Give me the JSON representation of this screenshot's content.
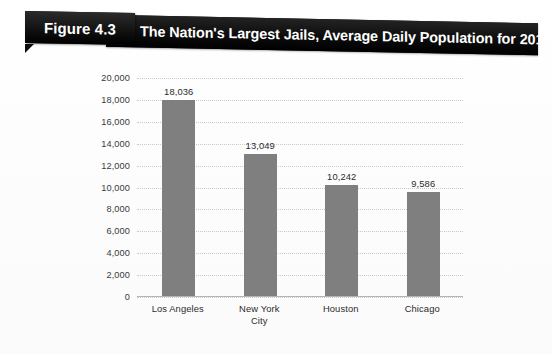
{
  "figure": {
    "number_label": "Figure 4.3",
    "title": "The Nation's Largest Jails, Average Daily Population for 2010"
  },
  "colors": {
    "banner_bg": "#111111",
    "banner_text": "#ffffff",
    "bar_fill": "#7f7f7f",
    "gridline": "#c9c9c9",
    "page_bg": "#ffffff"
  },
  "chart_data": {
    "type": "bar",
    "title": "The Nation's Largest Jails, Average Daily Population for 2010",
    "xlabel": "",
    "ylabel": "",
    "categories": [
      "Los Angeles",
      "New York\nCity",
      "Houston",
      "Chicago"
    ],
    "values": [
      18036,
      13049,
      10242,
      9586
    ],
    "value_labels": [
      "18,036",
      "13,049",
      "10,242",
      "9,586"
    ],
    "ylim": [
      0,
      20000
    ],
    "ytick_values": [
      0,
      2000,
      4000,
      6000,
      8000,
      10000,
      12000,
      14000,
      16000,
      18000,
      20000
    ],
    "ytick_labels": [
      "0",
      "2,000",
      "4,000",
      "6,000",
      "8,000",
      "10,000",
      "12,000",
      "14,000",
      "16,000",
      "18,000",
      "20,000"
    ],
    "grid": true,
    "legend": false
  }
}
